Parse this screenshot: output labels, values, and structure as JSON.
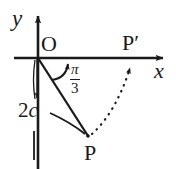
{
  "figure": {
    "type": "geometry-diagram",
    "background_color": "#ffffff",
    "stroke_color": "#1a1a1a",
    "axes": {
      "y_axis_label": "y",
      "x_axis_label": "x",
      "origin_label": "O",
      "y_axis": {
        "x": 38,
        "top": 12,
        "bottom": 169
      },
      "x_axis": {
        "y": 58,
        "left": 14,
        "right": 170
      }
    },
    "points": [
      {
        "name": "O",
        "label": "O",
        "x": 38,
        "y": 58
      },
      {
        "name": "P",
        "label": "P",
        "x": 88,
        "y": 136
      },
      {
        "name": "P-prime",
        "label": "P′",
        "x": 131,
        "y": 58
      }
    ],
    "angle": {
      "label_numerator": "π",
      "label_denominator": "3",
      "label_plain": "π/3",
      "vertex": "O",
      "from": "OP",
      "to": "positive x-axis"
    },
    "measure": {
      "label_prefix": "2",
      "label_variable": "c",
      "label_plain": "2c",
      "measures": "length of segment OP"
    },
    "dotted_path": {
      "from": "P",
      "to": "P-prime",
      "style": "dotted",
      "arrow": "at P-prime pointing up"
    }
  }
}
